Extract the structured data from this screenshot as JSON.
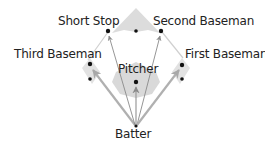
{
  "diagram": {
    "type": "baseball-field-positions",
    "positions": {
      "short_stop": "Short Stop",
      "second_baseman": "Second Baseman",
      "third_baseman": "Third Baseman",
      "first_baseman": "First Baseman",
      "pitcher": "Pitcher",
      "batter": "Batter"
    },
    "arrows_from": "Batter",
    "arrows_to": [
      "Third Baseman",
      "Short Stop",
      "Pitcher",
      "Second Baseman",
      "First Baseman"
    ],
    "colors": {
      "field_fill": "#dcdcdc",
      "mound_fill": "#d9d9d9",
      "outline": "#cccccc",
      "arrow_thin": "#8a8a8a",
      "arrow_thick": "#b0b0b0",
      "dot": "#111111",
      "text": "#222222"
    }
  }
}
